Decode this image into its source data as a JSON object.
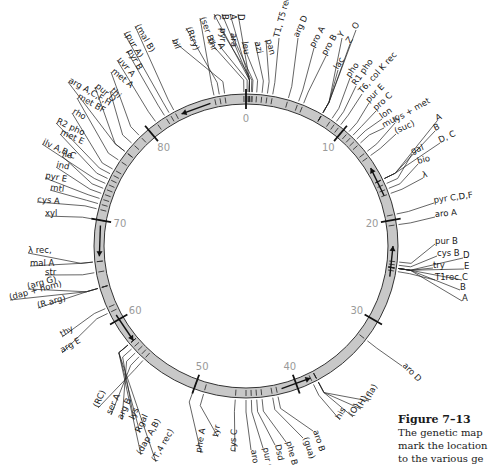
{
  "figure": {
    "caption_title": "Figure 7–13",
    "caption_lines": [
      "The genetic map",
      "mark the location",
      "to the various ge"
    ]
  },
  "ring": {
    "center": [
      246,
      246
    ],
    "outer_radius": 152,
    "inner_radius": 142,
    "fill_color": "#c8c8c8",
    "stroke_color": "#333333",
    "scale_color": "#9a9a9a",
    "scale_marks": [
      {
        "label": "0",
        "minute": 0
      },
      {
        "label": "10",
        "minute": 10
      },
      {
        "label": "20",
        "minute": 20
      },
      {
        "label": "30",
        "minute": 30
      },
      {
        "label": "40",
        "minute": 40
      },
      {
        "label": "50",
        "minute": 50
      },
      {
        "label": "60",
        "minute": 60
      },
      {
        "label": "70",
        "minute": 70
      },
      {
        "label": "80",
        "minute": 80
      }
    ],
    "total_minutes": 90,
    "arrows": [
      {
        "name": "arrow-top",
        "minute": 85
      },
      {
        "name": "arrow-right-upper",
        "minute": 16
      },
      {
        "name": "arrow-right-lower",
        "minute": 24
      },
      {
        "name": "arrow-bottom",
        "minute": 40
      },
      {
        "name": "arrow-lower-left",
        "minute": 59
      },
      {
        "name": "arrow-left",
        "minute": 68
      }
    ]
  },
  "genes": [
    {
      "label": "D",
      "minute": 0.3,
      "x": 238,
      "y": 14,
      "rot": 90
    },
    {
      "label": "A",
      "minute": 0.3,
      "x": 230,
      "y": 14,
      "rot": 90
    },
    {
      "label": "B",
      "minute": 0.3,
      "x": 222,
      "y": 14,
      "rot": 90
    },
    {
      "label": "C",
      "minute": 0.3,
      "x": 214,
      "y": 14,
      "rot": 90
    },
    {
      "label": "pyr",
      "minute": 0.5,
      "x": 220,
      "y": 28,
      "rot": 90
    },
    {
      "label": "ara",
      "minute": 0.6,
      "x": 231,
      "y": 33,
      "rot": 90
    },
    {
      "label": "thr",
      "minute": -0.2,
      "x": 208,
      "y": 40,
      "rot": 70
    },
    {
      "label": "A",
      "minute": 0.1,
      "x": 218,
      "y": 44,
      "rot": 70
    },
    {
      "label": "leu",
      "minute": 1,
      "x": 242,
      "y": 42,
      "rot": 80
    },
    {
      "label": "azi",
      "minute": 1.5,
      "x": 255,
      "y": 42,
      "rot": 80
    },
    {
      "label": "pan",
      "minute": 2,
      "x": 266,
      "y": 40,
      "rot": 75
    },
    {
      "label": "T1, T5 rec",
      "minute": 2.5,
      "x": 279,
      "y": 38,
      "rot": -75
    },
    {
      "label": "(ser B)",
      "minute": 87,
      "x": 200,
      "y": 18,
      "rot": 70
    },
    {
      "label": "(Rtry)",
      "minute": 87.5,
      "x": 186,
      "y": 28,
      "rot": 70
    },
    {
      "label": "bil",
      "minute": 88,
      "x": 172,
      "y": 40,
      "rot": 70
    },
    {
      "label": "arg D",
      "minute": 4,
      "x": 298,
      "y": 38,
      "rot": -65
    },
    {
      "label": "pro A",
      "minute": 5,
      "x": 314,
      "y": 48,
      "rot": -60
    },
    {
      "label": "pro B",
      "minute": 5.5,
      "x": 326,
      "y": 56,
      "rot": -60
    },
    {
      "label": "lac",
      "minute": 7.5,
      "x": 338,
      "y": 70,
      "rot": -58
    },
    {
      "label": "Y",
      "minute": 7.5,
      "x": 342,
      "y": 38,
      "rot": -55
    },
    {
      "label": "Z",
      "minute": 7.5,
      "x": 350,
      "y": 44,
      "rot": -55
    },
    {
      "label": "O",
      "minute": 7.5,
      "x": 356,
      "y": 30,
      "rot": -55
    },
    {
      "label": "pho",
      "minute": 8.5,
      "x": 350,
      "y": 78,
      "rot": -55
    },
    {
      "label": "R1 pho",
      "minute": 9,
      "x": 356,
      "y": 86,
      "rot": -55
    },
    {
      "label": "T6, col K rec",
      "minute": 9.5,
      "x": 362,
      "y": 94,
      "rot": -48
    },
    {
      "label": "pur E",
      "minute": 10.5,
      "x": 369,
      "y": 103,
      "rot": -45
    },
    {
      "label": "pro C",
      "minute": 11,
      "x": 376,
      "y": 111,
      "rot": -42
    },
    {
      "label": "lon",
      "minute": 11.5,
      "x": 382,
      "y": 119,
      "rot": -35
    },
    {
      "label": "muc",
      "minute": 12,
      "x": 384,
      "y": 128,
      "rot": -30
    },
    {
      "label": "lys + met",
      "minute": 13,
      "x": 395,
      "y": 123,
      "rot": -30
    },
    {
      "label": "(suc)",
      "minute": 13.5,
      "x": 396,
      "y": 134,
      "rot": -25
    },
    {
      "label": "A",
      "minute": 16,
      "x": 437,
      "y": 121,
      "rot": -25
    },
    {
      "label": "B",
      "minute": 16,
      "x": 435,
      "y": 131,
      "rot": -25
    },
    {
      "label": "D, C",
      "minute": 16,
      "x": 440,
      "y": 143,
      "rot": -25
    },
    {
      "label": "gal",
      "minute": 16.5,
      "x": 412,
      "y": 154,
      "rot": -20
    },
    {
      "label": "bio",
      "minute": 17,
      "x": 418,
      "y": 164,
      "rot": -15
    },
    {
      "label": "λ",
      "minute": 17.5,
      "x": 423,
      "y": 178,
      "rot": -15
    },
    {
      "label": "pyr C,D,F",
      "minute": 19.5,
      "x": 434,
      "y": 203,
      "rot": -8
    },
    {
      "label": "aro A",
      "minute": 20.5,
      "x": 435,
      "y": 217,
      "rot": -5
    },
    {
      "label": "pur B",
      "minute": 24,
      "x": 435,
      "y": 244,
      "rot": 0
    },
    {
      "label": "cys B",
      "minute": 24.3,
      "x": 437,
      "y": 256,
      "rot": 0
    },
    {
      "label": "try",
      "minute": 24.6,
      "x": 433,
      "y": 268,
      "rot": 0
    },
    {
      "label": "T1rec",
      "minute": 24.9,
      "x": 435,
      "y": 280,
      "rot": 0
    },
    {
      "label": "D",
      "minute": 24.6,
      "x": 463,
      "y": 258,
      "rot": 0
    },
    {
      "label": "E",
      "minute": 24.6,
      "x": 464,
      "y": 269,
      "rot": 0
    },
    {
      "label": "C",
      "minute": 24.6,
      "x": 462,
      "y": 280,
      "rot": 0
    },
    {
      "label": "B",
      "minute": 24.6,
      "x": 460,
      "y": 290,
      "rot": 0
    },
    {
      "label": "A",
      "minute": 24.6,
      "x": 462,
      "y": 301,
      "rot": 0
    },
    {
      "label": "aro D",
      "minute": 32,
      "x": 402,
      "y": 366,
      "rot": 45
    },
    {
      "label": "(fla)",
      "minute": 38,
      "x": 369,
      "y": 401,
      "rot": -60
    },
    {
      "label": "(H)",
      "minute": 38,
      "x": 361,
      "y": 409,
      "rot": -60
    },
    {
      "label": "(O)",
      "minute": 38,
      "x": 353,
      "y": 417,
      "rot": -60
    },
    {
      "label": "his",
      "minute": 38.5,
      "x": 340,
      "y": 420,
      "rot": -60
    },
    {
      "label": "aro B",
      "minute": 42,
      "x": 313,
      "y": 431,
      "rot": 72
    },
    {
      "label": "(gua)",
      "minute": 42.5,
      "x": 303,
      "y": 438,
      "rot": 72
    },
    {
      "label": "phe B",
      "minute": 43.5,
      "x": 286,
      "y": 442,
      "rot": 75
    },
    {
      "label": "Dsd",
      "minute": 44,
      "x": 275,
      "y": 445,
      "rot": 78
    },
    {
      "label": "pur C",
      "minute": 44.5,
      "x": 263,
      "y": 448,
      "rot": 80
    },
    {
      "label": "aro C",
      "minute": 45,
      "x": 251,
      "y": 450,
      "rot": 82
    },
    {
      "label": "cys C",
      "minute": 46,
      "x": 235,
      "y": 452,
      "rot": -85
    },
    {
      "label": "tyr",
      "minute": 49,
      "x": 218,
      "y": 437,
      "rot": -80
    },
    {
      "label": "phe A",
      "minute": 50,
      "x": 201,
      "y": 453,
      "rot": -80
    },
    {
      "label": "(RC)",
      "minute": 55.5,
      "x": 98,
      "y": 408,
      "rot": -65
    },
    {
      "label": "ser A",
      "minute": 56,
      "x": 111,
      "y": 415,
      "rot": -65
    },
    {
      "label": "arg B",
      "minute": 56.5,
      "x": 122,
      "y": 420,
      "rot": -65
    },
    {
      "label": "lys",
      "minute": 57,
      "x": 134,
      "y": 420,
      "rot": -65
    },
    {
      "label": "Rgal",
      "minute": 57.5,
      "x": 140,
      "y": 433,
      "rot": -65
    },
    {
      "label": "(dap A,B)",
      "minute": 57.5,
      "x": 141,
      "y": 455,
      "rot": -60
    },
    {
      "label": "(T,4 rec)",
      "minute": 57.5,
      "x": 156,
      "y": 462,
      "rot": -60
    },
    {
      "label": "thy",
      "minute": 61.5,
      "x": 62,
      "y": 337,
      "rot": -30
    },
    {
      "label": "arg E",
      "minute": 61,
      "x": 62,
      "y": 353,
      "rot": -30
    },
    {
      "label": "(R arg)",
      "minute": 63.5,
      "x": 38,
      "y": 308,
      "rot": -15
    },
    {
      "label": "(dap + hom)",
      "minute": 63.5,
      "x": 10,
      "y": 300,
      "rot": -15
    },
    {
      "label": "(arg G)",
      "minute": 63.5,
      "x": 28,
      "y": 289,
      "rot": -15
    },
    {
      "label": "str",
      "minute": 65,
      "x": 45,
      "y": 275,
      "rot": 0
    },
    {
      "label": "λ rec,",
      "minute": 66,
      "x": 28,
      "y": 253,
      "rot": 0
    },
    {
      "label": "mal A",
      "minute": 66,
      "x": 30,
      "y": 266,
      "rot": 0
    },
    {
      "label": "xyl",
      "minute": 70,
      "x": 45,
      "y": 216,
      "rot": 0
    },
    {
      "label": "cys A",
      "minute": 71,
      "x": 37,
      "y": 202,
      "rot": 5
    },
    {
      "label": "mtl",
      "minute": 71.5,
      "x": 50,
      "y": 190,
      "rot": 8
    },
    {
      "label": "pyr E",
      "minute": 72,
      "x": 45,
      "y": 178,
      "rot": 10
    },
    {
      "label": "ind",
      "minute": 72.5,
      "x": 56,
      "y": 167,
      "rot": 12
    },
    {
      "label": "ile",
      "minute": 73,
      "x": 62,
      "y": 156,
      "rot": 15
    },
    {
      "label": "ilv A,B,C",
      "minute": 73.5,
      "x": 42,
      "y": 144,
      "rot": 25
    },
    {
      "label": "met E",
      "minute": 74,
      "x": 60,
      "y": 134,
      "rot": 25
    },
    {
      "label": "R2 pho",
      "minute": 74.5,
      "x": 56,
      "y": 123,
      "rot": 25
    },
    {
      "label": "rho",
      "minute": 75,
      "x": 72,
      "y": 113,
      "rot": 30
    },
    {
      "label": "met BF",
      "minute": 76,
      "x": 77,
      "y": 98,
      "rot": 30
    },
    {
      "label": "arg A,C,F,H",
      "minute": 77,
      "x": 68,
      "y": 82,
      "rot": 30
    },
    {
      "label": "pur D",
      "minute": 77,
      "x": 95,
      "y": 87,
      "rot": 40
    },
    {
      "label": "thi",
      "minute": 78,
      "x": 110,
      "y": 91,
      "rot": 45
    },
    {
      "label": "met A",
      "minute": 79,
      "x": 111,
      "y": 72,
      "rot": 40
    },
    {
      "label": "uvr A",
      "minute": 81,
      "x": 117,
      "y": 60,
      "rot": 50
    },
    {
      "label": "pyr B",
      "minute": 82,
      "x": 127,
      "y": 51,
      "rot": 60
    },
    {
      "label": "(pur A)",
      "minute": 82.5,
      "x": 124,
      "y": 33,
      "rot": 60
    },
    {
      "label": "(mal B)",
      "minute": 83,
      "x": 135,
      "y": 26,
      "rot": 60
    }
  ]
}
